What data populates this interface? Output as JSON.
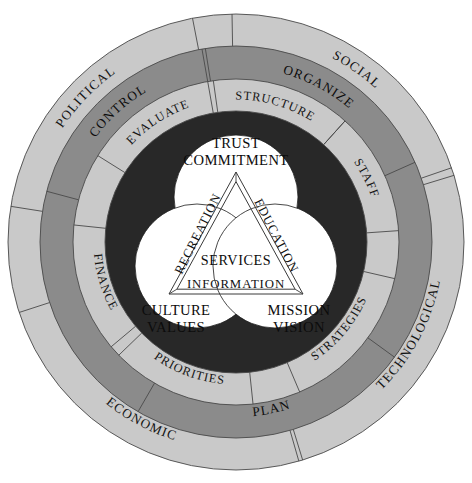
{
  "diagram": {
    "center": {
      "x": 236,
      "y": 242
    },
    "colors": {
      "ring_outer": "#c9c9c9",
      "ring_mid": "#8b8b8b",
      "ring_inner": "#c9c9c9",
      "ring_core": "#282828",
      "venn_fill": "#ffffff",
      "outline": "#4a4a4a",
      "text": "#141414",
      "background": "#ffffff"
    },
    "rings": [
      {
        "name": "environment-ring",
        "shade": "light",
        "r_outer": 228,
        "r_inner": 196,
        "segments": [
          {
            "label": "SOCIAL",
            "mid_angle": -55,
            "sweep": 72
          },
          {
            "label": "TECHNOLOGICAL",
            "mid_angle": 28,
            "sweep": 90
          },
          {
            "label": "ECONOMIC",
            "mid_angle": 118,
            "sweep": 88
          },
          {
            "label": "POLITICAL",
            "mid_angle": -136,
            "sweep": 70
          }
        ]
      },
      {
        "name": "management-ring",
        "shade": "medium",
        "r_outer": 196,
        "r_inner": 163,
        "segments": [
          {
            "label": "ORGANIZE",
            "mid_angle": -62,
            "sweep": 76
          },
          {
            "label": "PLAN",
            "mid_angle": 78,
            "sweep": 84
          },
          {
            "label": "CONTROL",
            "mid_angle": -132,
            "sweep": 66
          }
        ]
      },
      {
        "name": "resources-ring",
        "shade": "light",
        "r_outer": 163,
        "r_inner": 131,
        "segments": [
          {
            "label": "STRUCTURE",
            "mid_angle": -74,
            "sweep": 52
          },
          {
            "label": "STAFF",
            "mid_angle": -26,
            "sweep": 44
          },
          {
            "label": "STRATEGIES",
            "mid_angle": 40,
            "sweep": 54
          },
          {
            "label": "PRIORITIES",
            "mid_angle": 110,
            "sweep": 52
          },
          {
            "label": "FINANCE",
            "mid_angle": 163,
            "sweep": 46
          },
          {
            "label": "EVALUATE",
            "mid_angle": -123,
            "sweep": 50
          }
        ]
      },
      {
        "name": "core-ring",
        "shade": "dark",
        "r_outer": 131,
        "r_inner": 0,
        "segments": []
      }
    ],
    "venn": {
      "name": "values-venn",
      "radius": 62,
      "circles": [
        {
          "name": "trust-circle",
          "cx": 236,
          "cy": 197,
          "lines": [
            "TRUST",
            "COMMITMENT"
          ],
          "label_x": 236,
          "label_y": 148
        },
        {
          "name": "culture-circle",
          "cx": 197,
          "cy": 266,
          "lines": [
            "CULTURE",
            "VALUES"
          ],
          "label_x": 176,
          "label_y": 315
        },
        {
          "name": "mission-circle",
          "cx": 275,
          "cy": 266,
          "lines": [
            "MISSION",
            "VISION"
          ],
          "label_x": 299,
          "label_y": 315
        }
      ]
    },
    "triangle": {
      "name": "services-triangle",
      "apex_top": {
        "x": 236,
        "y": 172
      },
      "apex_bottom_left": {
        "x": 169,
        "y": 294
      },
      "apex_bottom_right": {
        "x": 303,
        "y": 294
      },
      "center_label": "SERVICES",
      "center_label_x": 236,
      "center_label_y": 265,
      "edges": [
        {
          "name": "education-edge",
          "label": "EDUCATION",
          "orientation": "right"
        },
        {
          "name": "recreation-edge",
          "label": "RECREATION",
          "orientation": "left"
        },
        {
          "name": "information-edge",
          "label": "INFORMATION",
          "orientation": "bottom"
        }
      ]
    }
  }
}
